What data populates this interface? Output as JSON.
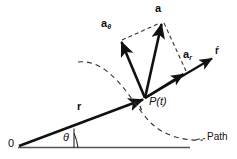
{
  "diagram": {
    "colors": {
      "stroke": "#111111",
      "dashed": "#333333",
      "baseline": "#555555",
      "background": "#ffffff"
    },
    "labels": {
      "acceleration": "a",
      "transverse_component": "a",
      "transverse_subscript": "θ",
      "radial_component": "a",
      "radial_subscript": "r",
      "position_vector": "r",
      "unit_vector_r": "ŕ",
      "point": "P(t)",
      "angle": "θ",
      "origin": "0",
      "path": "Path"
    },
    "geometry": {
      "origin_point": [
        18,
        146
      ],
      "point_P": [
        145,
        98
      ],
      "a_tip": [
        163,
        22
      ],
      "a_theta_tip": [
        120,
        40
      ],
      "a_r_tip": [
        186,
        72
      ],
      "r_unit_tip": [
        215,
        57
      ],
      "baseline_end": [
        190,
        148
      ],
      "angle_value_deg": 21
    }
  }
}
